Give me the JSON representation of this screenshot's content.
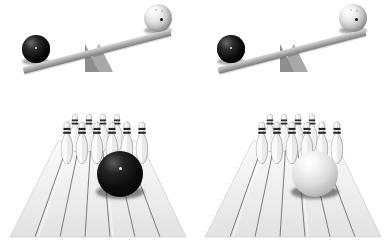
{
  "image": {
    "title": "Bowling ball weight comparison — balance scales and bowling lanes",
    "background_color": "#ffffff",
    "layout": "2x2 grid: top row balance scales, bottom row bowling lanes"
  },
  "palette": {
    "dark_ball": "#000000",
    "light_ball": "#e8e8e8",
    "plank": "#b0b0b0",
    "fulcrum": "#a8a8a8",
    "lane_wood": "#efefef",
    "lane_seam": "#4a4a4a",
    "pin_body": "#f0f0f0",
    "pin_stripe": "#2c2c2c"
  },
  "panels": [
    {
      "id": "seesaw-left",
      "type": "balance-scale",
      "position": "top-left",
      "tilt_degrees": -14.5,
      "low_side": "left",
      "high_side": "right",
      "left_ball": {
        "name": "black-bowling-ball",
        "color": "#000000",
        "diameter_px": 28,
        "holes": 1
      },
      "right_ball": {
        "name": "white-bowling-ball",
        "color": "#e8e8e8",
        "diameter_px": 28,
        "holes": 3
      },
      "fulcrum": {
        "name": "triangular-fulcrum",
        "color": "#a8a8a8"
      }
    },
    {
      "id": "seesaw-right",
      "type": "balance-scale",
      "position": "top-right",
      "tilt_degrees": -14.5,
      "low_side": "left",
      "high_side": "right",
      "left_ball": {
        "name": "black-bowling-ball",
        "color": "#000000",
        "diameter_px": 28,
        "holes": 1
      },
      "right_ball": {
        "name": "white-bowling-ball",
        "color": "#e8e8e8",
        "diameter_px": 28,
        "holes": 3
      },
      "fulcrum": {
        "name": "triangular-fulcrum",
        "color": "#a8a8a8"
      }
    },
    {
      "id": "lane-left",
      "type": "bowling-lane",
      "position": "bottom-left",
      "ball": {
        "name": "black-bowling-ball",
        "color": "#000000",
        "diameter_px": 46
      },
      "pin_count": 10,
      "pin_rows": [
        4,
        3,
        2,
        1
      ],
      "lane_planks": 7
    },
    {
      "id": "lane-right",
      "type": "bowling-lane",
      "position": "bottom-right",
      "ball": {
        "name": "white-bowling-ball",
        "color": "#e8e8e8",
        "diameter_px": 46
      },
      "pin_count": 10,
      "pin_rows": [
        4,
        3,
        2,
        1
      ],
      "lane_planks": 7
    }
  ],
  "pin_layout": {
    "front_row_x": [
      62,
      76,
      90,
      104,
      118,
      132
    ],
    "back_row_x": [
      69,
      83,
      97,
      111,
      125
    ],
    "front_row_y": 24,
    "back_row_y": 14
  }
}
